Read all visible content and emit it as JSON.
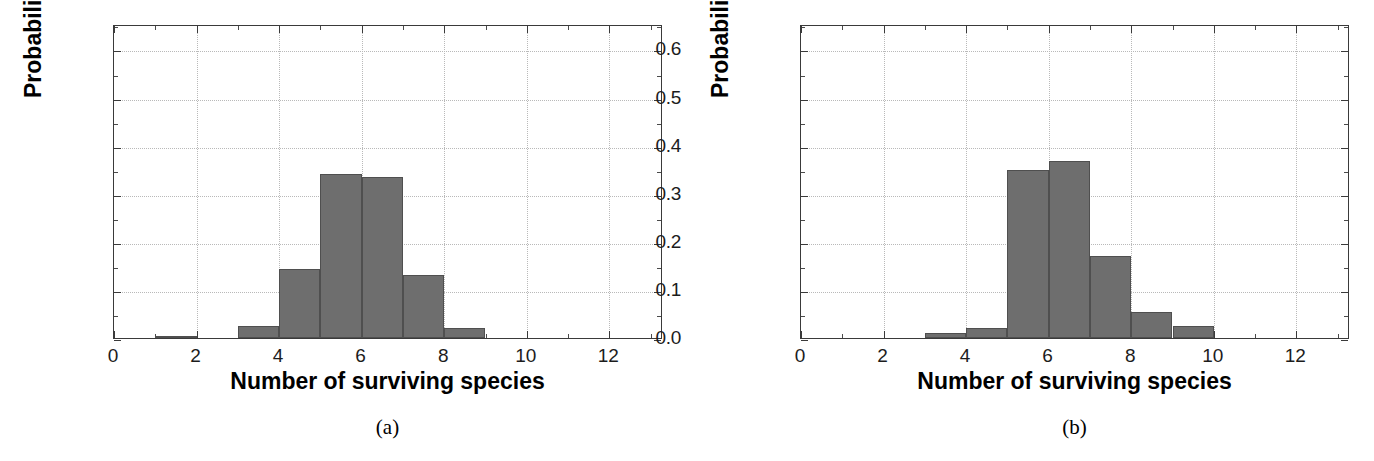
{
  "figure": {
    "panels": [
      {
        "caption": "(a)",
        "caption_open": "(",
        "caption_letter": "a",
        "caption_close": ")",
        "chart_data": {
          "type": "bar",
          "title": "",
          "xlabel": "Number of surviving species",
          "ylabel": "Probability",
          "xlim": [
            0,
            13.3
          ],
          "ylim": [
            0,
            0.653
          ],
          "grid": true,
          "legend": "none",
          "xticks": [
            "0",
            "2",
            "4",
            "6",
            "8",
            "10",
            "12"
          ],
          "xtick_values": [
            0,
            2,
            4,
            6,
            8,
            10,
            12
          ],
          "yticks": [
            "0.0",
            "0.1",
            "0.2",
            "0.3",
            "0.4",
            "0.5",
            "0.6"
          ],
          "ytick_values": [
            0.0,
            0.1,
            0.2,
            0.3,
            0.4,
            0.5,
            0.6
          ],
          "bin_edges": [
            1,
            2,
            3,
            4,
            5,
            6,
            7,
            8,
            9
          ],
          "categories": [
            "1-2",
            "2-3",
            "3-4",
            "4-5",
            "5-6",
            "6-7",
            "7-8",
            "8-9"
          ],
          "values": [
            0.005,
            0.0,
            0.025,
            0.143,
            0.342,
            0.334,
            0.132,
            0.021
          ]
        }
      },
      {
        "caption": "(b)",
        "caption_open": "(",
        "caption_letter": "b",
        "caption_close": ")",
        "chart_data": {
          "type": "bar",
          "title": "",
          "xlabel": "Number of surviving species",
          "ylabel": "Probability",
          "xlim": [
            0,
            13.3
          ],
          "ylim": [
            0,
            0.653
          ],
          "grid": true,
          "legend": "none",
          "xticks": [
            "0",
            "2",
            "4",
            "6",
            "8",
            "10",
            "12"
          ],
          "xtick_values": [
            0,
            2,
            4,
            6,
            8,
            10,
            12
          ],
          "yticks": [
            "0.0",
            "0.1",
            "0.2",
            "0.3",
            "0.4",
            "0.5",
            "0.6"
          ],
          "ytick_values": [
            0.0,
            0.1,
            0.2,
            0.3,
            0.4,
            0.5,
            0.6
          ],
          "bin_edges": [
            3,
            4,
            5,
            6,
            7,
            8,
            9,
            10
          ],
          "categories": [
            "3-4",
            "4-5",
            "5-6",
            "6-7",
            "7-8",
            "8-9",
            "9-10"
          ],
          "values": [
            0.011,
            0.021,
            0.349,
            0.368,
            0.17,
            0.055,
            0.025
          ]
        }
      }
    ]
  },
  "style": {
    "bar_color": "#6e6e6e",
    "bar_edge_color": "#4f4f4f",
    "axis_color": "#3a3a3a",
    "grid_color": "#b9b9b9",
    "text_color": "#000000",
    "background": "#ffffff"
  }
}
